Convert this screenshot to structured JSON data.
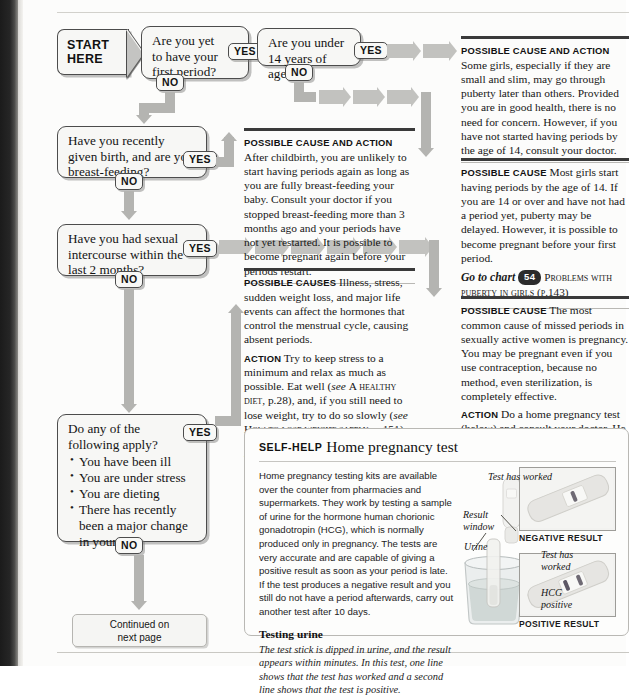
{
  "chart": {
    "start_line1": "START",
    "start_line2": "HERE",
    "yes": "YES",
    "no": "NO",
    "continued": "Continued on\nnext page"
  },
  "questions": [
    {
      "id": "q1",
      "text": "Are you yet\nto have your\nfirst period?"
    },
    {
      "id": "q2",
      "text": "Are you under\n14 years of age?"
    },
    {
      "id": "q3",
      "text": "Have you recently\ngiven birth, and are you\nbreast-feeding?"
    },
    {
      "id": "q4",
      "text": "Have you had sexual\nintercourse within the\nlast 2 months?"
    },
    {
      "id": "q5",
      "text": "Do any of the\nfollowing apply?",
      "bullets": [
        "You have been ill",
        "You are under stress",
        "You are dieting",
        "There has recently\nbeen a major change\nin your life"
      ]
    }
  ],
  "advice": {
    "a1": {
      "label": "Possible cause and action",
      "body": "Some girls, especially if they are small and slim, may go through puberty later than others. Provided you are in good health, there is no need for concern. However, if you have not started having periods by the age of 14, consult your doctor."
    },
    "a2": {
      "label": "Possible cause",
      "body": "Most girls start having periods by the age of 14. If you are 14 or over and have not had a period yet, puberty may be delayed. However, it is possible to become pregnant before your first period.",
      "goto_prefix": "Go to chart",
      "goto_number": "54",
      "goto_title": "Problems with puberty in girls",
      "goto_page": "(p.143)"
    },
    "a3": {
      "label": "Possible cause and action",
      "body": "After childbirth, you are unlikely to start having periods again as long as you are fully breast-feeding your baby. Consult your doctor if you stopped breast-feeding more than 3 months ago and your periods have not yet restarted. It is possible to become pregnant again before your periods restart."
    },
    "a4": {
      "label": "Possible causes",
      "body": "Illness, stress, sudden weight loss, and major life events can affect the hormones that control the menstrual cycle, causing absent periods.",
      "action_label": "Action",
      "action_part1": "Try to keep stress to a minimum and relax as much as possible. Eat well (",
      "action_see1": "see",
      "action_ref1": "A healthy diet",
      "action_part2": ", p.28), and, if you still need to lose weight, try to do so slowly (",
      "action_see2": "see",
      "action_ref2": "How to lose weight safely",
      "action_part3": ", p.151). If your periods do not start again within 3 months, consult your doctor."
    },
    "a5": {
      "label": "Possible cause",
      "body": "The most common cause of missed periods in sexually active women is pregnancy. You may be pregnant even if you use contraception, because no method, even sterilization, is completely effective.",
      "action_label": "Action",
      "action_body": "Do a home pregnancy test (below) and consult your doctor. He or she may arrange for ultrasound scanning (p.41)."
    }
  },
  "selfhelp": {
    "kicker": "Self-help",
    "title": "Home pregnancy test",
    "body": "Home pregnancy testing kits are available over the counter from pharmacies and supermarkets. They work by testing a sample of urine for the hormone human chorionic gonadotropin (HCG), which is normally produced only in pregnancy. The tests are very accurate and are capable of giving a positive result as soon as your period is late. If the test produces a negative result and you still do not have a period afterwards, carry out another test after 10 days.",
    "sub_heading": "Testing urine",
    "caption": "The test stick is dipped in urine, and the result appears within minutes. In this test, one line shows that the test has worked and a second line shows that the test is positive.",
    "labels": {
      "test_worked_1": "Test has worked",
      "result_window": "Result\nwindow",
      "urine": "Urine",
      "test_has_worked_2": "Test has\nworked",
      "hcg_positive": "HCG\npositive",
      "negative_result": "NEGATIVE RESULT",
      "positive_result": "POSITIVE RESULT"
    }
  },
  "colors": {
    "connector": "#b4b4b1",
    "box_border": "#4c4c4c",
    "rule": "#3a3a3a",
    "paper": "#fcfcfb"
  }
}
